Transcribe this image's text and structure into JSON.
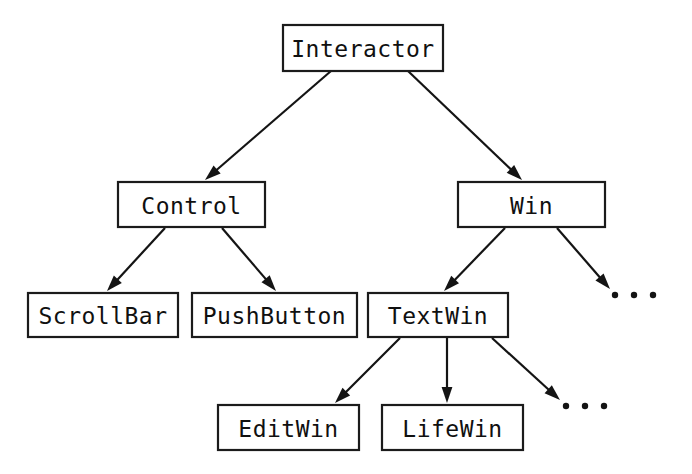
{
  "diagram": {
    "type": "class-hierarchy-tree",
    "background_color": "#ffffff",
    "line_color": "#141414",
    "text_color": "#101010",
    "nodes": [
      {
        "id": "interactor",
        "label": "Interactor",
        "x": 283,
        "y": 25,
        "w": 160,
        "h": 46,
        "level": 0
      },
      {
        "id": "control",
        "label": "Control",
        "x": 118,
        "y": 182,
        "w": 147,
        "h": 45,
        "level": 1
      },
      {
        "id": "win",
        "label": "Win",
        "x": 458,
        "y": 182,
        "w": 147,
        "h": 45,
        "level": 1
      },
      {
        "id": "scrollbar",
        "label": "ScrollBar",
        "x": 28,
        "y": 293,
        "w": 150,
        "h": 44,
        "level": 2
      },
      {
        "id": "pushbutton",
        "label": "PushButton",
        "x": 192,
        "y": 293,
        "w": 165,
        "h": 44,
        "level": 2
      },
      {
        "id": "textwin",
        "label": "TextWin",
        "x": 368,
        "y": 293,
        "w": 140,
        "h": 44,
        "level": 2
      },
      {
        "id": "editwin",
        "label": "EditWin",
        "x": 218,
        "y": 405,
        "w": 141,
        "h": 45,
        "level": 3
      },
      {
        "id": "lifewin",
        "label": "LifeWin",
        "x": 382,
        "y": 405,
        "w": 141,
        "h": 45,
        "level": 3
      }
    ],
    "edges": [
      {
        "id": "interactor-control",
        "from": "interactor",
        "to": "control",
        "x1": 331,
        "y1": 71,
        "x2": 205,
        "y2": 180
      },
      {
        "id": "interactor-win",
        "from": "interactor",
        "to": "win",
        "x1": 408,
        "y1": 71,
        "x2": 522,
        "y2": 180
      },
      {
        "id": "control-scrollbar",
        "from": "control",
        "to": "scrollbar",
        "x1": 165,
        "y1": 228,
        "x2": 107,
        "y2": 291
      },
      {
        "id": "control-pushbutton",
        "from": "control",
        "to": "pushbutton",
        "x1": 222,
        "y1": 228,
        "x2": 276,
        "y2": 291
      },
      {
        "id": "win-textwin",
        "from": "win",
        "to": "textwin",
        "x1": 505,
        "y1": 228,
        "x2": 444,
        "y2": 291
      },
      {
        "id": "win-ellipsis",
        "from": "win",
        "to": "ellipsis-win",
        "x1": 557,
        "y1": 228,
        "x2": 610,
        "y2": 289
      },
      {
        "id": "textwin-editwin",
        "from": "textwin",
        "to": "editwin",
        "x1": 400,
        "y1": 338,
        "x2": 335,
        "y2": 403
      },
      {
        "id": "textwin-lifewin",
        "from": "textwin",
        "to": "lifewin",
        "x1": 447,
        "y1": 338,
        "x2": 447,
        "y2": 403
      },
      {
        "id": "textwin-ellipsis",
        "from": "textwin",
        "to": "ellipsis-textwin",
        "x1": 492,
        "y1": 338,
        "x2": 560,
        "y2": 400
      }
    ],
    "ellipses": [
      {
        "id": "ellipsis-win",
        "label": "...",
        "cx": 634,
        "cy": 295,
        "dot_count": 3,
        "dot_spacing": 19,
        "dot_radius": 3.2
      },
      {
        "id": "ellipsis-textwin",
        "label": "...",
        "cx": 585,
        "cy": 406,
        "dot_count": 3,
        "dot_spacing": 19,
        "dot_radius": 3.2
      }
    ]
  }
}
